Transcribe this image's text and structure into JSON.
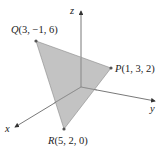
{
  "diagram": {
    "type": "3d-coordinate-triangle",
    "axes": {
      "x": {
        "label": "x"
      },
      "y": {
        "label": "y"
      },
      "z": {
        "label": "z"
      }
    },
    "points": {
      "P": {
        "name": "P",
        "coords": "(1, 3, 2)"
      },
      "Q": {
        "name": "Q",
        "coords": "(3, −1, 6)"
      },
      "R": {
        "name": "R",
        "coords": "(5, 2, 0)"
      }
    },
    "colors": {
      "triangle_fill": "#b8b8b8",
      "axis": "#333333"
    }
  }
}
